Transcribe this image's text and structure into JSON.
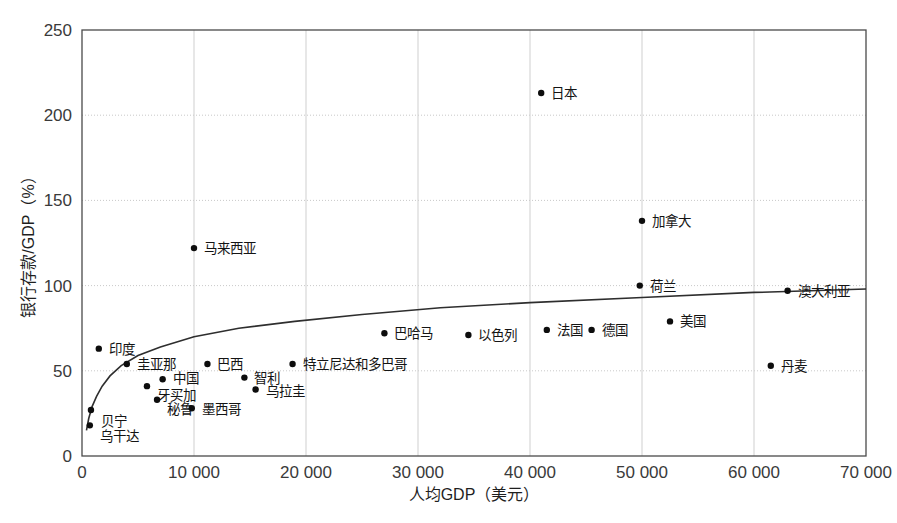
{
  "chart_data": {
    "type": "scatter",
    "title": "",
    "xlabel": "人均GDP（美元）",
    "ylabel": "银行存款/GDP（%）",
    "xlim": [
      0,
      70000
    ],
    "ylim": [
      0,
      250
    ],
    "xticks": [
      0,
      10000,
      20000,
      30000,
      40000,
      50000,
      60000,
      70000
    ],
    "xticklabels": [
      "0",
      "10 000",
      "20 000",
      "30 000",
      "40 000",
      "50 000",
      "60 000",
      "70 000"
    ],
    "yticks": [
      0,
      50,
      100,
      150,
      200,
      250
    ],
    "yticklabels": [
      "0",
      "50",
      "100",
      "150",
      "200",
      "250"
    ],
    "grid": "both",
    "legend": "none",
    "marker_color": "#0d0d0d",
    "trend_color": "#2e2e2e",
    "frame_color": "#4a4a4a",
    "points": [
      {
        "label": "乌干达",
        "x": 700,
        "y": 18,
        "lx": 10,
        "ly": 16
      },
      {
        "label": "贝宁",
        "x": 800,
        "y": 27,
        "lx": 10,
        "ly": 16
      },
      {
        "label": "印度",
        "x": 1500,
        "y": 63,
        "lx": 10,
        "ly": 5
      },
      {
        "label": "圭亚那",
        "x": 4000,
        "y": 54,
        "lx": 10,
        "ly": 5
      },
      {
        "label": "牙买加",
        "x": 5800,
        "y": 41,
        "lx": 10,
        "ly": 14
      },
      {
        "label": "秘鲁",
        "x": 6700,
        "y": 33,
        "lx": 10,
        "ly": 14
      },
      {
        "label": "中国",
        "x": 7200,
        "y": 45,
        "lx": 10,
        "ly": 4
      },
      {
        "label": "马来西亚",
        "x": 10000,
        "y": 122,
        "lx": 10,
        "ly": 5
      },
      {
        "label": "墨西哥",
        "x": 9800,
        "y": 28,
        "lx": 10,
        "ly": 6
      },
      {
        "label": "巴西",
        "x": 11200,
        "y": 54,
        "lx": 10,
        "ly": 5
      },
      {
        "label": "智利",
        "x": 14500,
        "y": 46,
        "lx": 10,
        "ly": 5
      },
      {
        "label": "乌拉圭",
        "x": 15500,
        "y": 39,
        "lx": 10,
        "ly": 6
      },
      {
        "label": "特立尼达和多巴哥",
        "x": 18800,
        "y": 54,
        "lx": 10,
        "ly": 5
      },
      {
        "label": "巴哈马",
        "x": 27000,
        "y": 72,
        "lx": 10,
        "ly": 5
      },
      {
        "label": "以色列",
        "x": 34500,
        "y": 71,
        "lx": 10,
        "ly": 5
      },
      {
        "label": "日本",
        "x": 41000,
        "y": 213,
        "lx": 10,
        "ly": 5
      },
      {
        "label": "法国",
        "x": 41500,
        "y": 74,
        "lx": 10,
        "ly": 5
      },
      {
        "label": "德国",
        "x": 45500,
        "y": 74,
        "lx": 10,
        "ly": 5
      },
      {
        "label": "荷兰",
        "x": 49800,
        "y": 100,
        "lx": 10,
        "ly": 5
      },
      {
        "label": "加拿大",
        "x": 50000,
        "y": 138,
        "lx": 10,
        "ly": 5
      },
      {
        "label": "美国",
        "x": 52500,
        "y": 79,
        "lx": 10,
        "ly": 5
      },
      {
        "label": "丹麦",
        "x": 61500,
        "y": 53,
        "lx": 10,
        "ly": 5
      },
      {
        "label": "澳大利亚",
        "x": 63000,
        "y": 97,
        "lx": 10,
        "ly": 5
      }
    ],
    "trend_curve": {
      "description": "logarithmic fit of bank deposits / GDP versus GDP per capita",
      "x": [
        400,
        600,
        900,
        1300,
        1800,
        2500,
        3500,
        5000,
        7000,
        10000,
        14000,
        19000,
        25000,
        32000,
        40000,
        50000,
        60000,
        70000
      ],
      "y": [
        15,
        22,
        29,
        35,
        41,
        47,
        53,
        59,
        64,
        70,
        75,
        79,
        83,
        87,
        90,
        93,
        96,
        98
      ]
    }
  }
}
